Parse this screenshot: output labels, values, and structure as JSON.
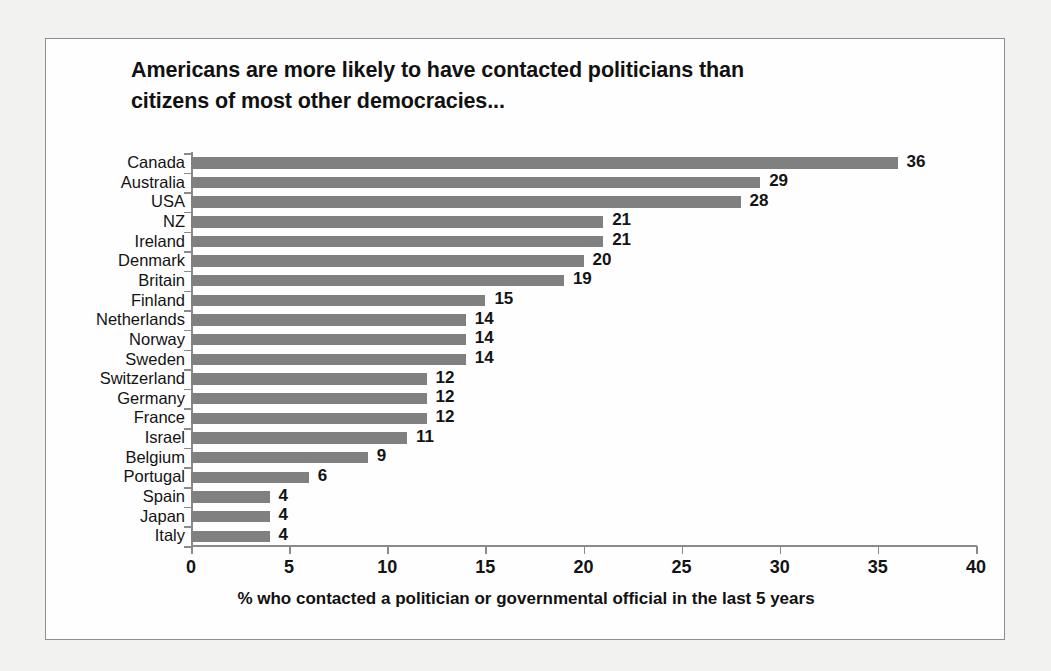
{
  "figure": {
    "background_color": "#f2f2f0",
    "panel_color": "#fefefe",
    "border_color": "#8d8d8d"
  },
  "title": {
    "line1": "Americans are more likely to have contacted politicians than",
    "line2": "citizens of most other democracies..."
  },
  "chart_data": {
    "type": "bar",
    "orientation": "horizontal",
    "title": "Americans are more likely to have contacted politicians than citizens of most other democracies...",
    "xlabel": "% who contacted a politician or governmental official in the last 5 years",
    "ylabel": "",
    "xlim": [
      0,
      40
    ],
    "xticks": [
      0,
      5,
      10,
      15,
      20,
      25,
      30,
      35,
      40
    ],
    "xtick_labels": [
      "0",
      "5",
      "10",
      "15",
      "20",
      "25",
      "30",
      "35",
      "40"
    ],
    "grid": false,
    "legend": false,
    "bar_color": "#808080",
    "data_labels": true,
    "categories": [
      "Canada",
      "Australia",
      "USA",
      "NZ",
      "Ireland",
      "Denmark",
      "Britain",
      "Finland",
      "Netherlands",
      "Norway",
      "Sweden",
      "Switzerland",
      "Germany",
      "France",
      "Israel",
      "Belgium",
      "Portugal",
      "Spain",
      "Japan",
      "Italy"
    ],
    "values": [
      36,
      29,
      28,
      21,
      21,
      20,
      19,
      15,
      14,
      14,
      14,
      12,
      12,
      12,
      11,
      9,
      6,
      4,
      4,
      4
    ],
    "value_labels": [
      "36",
      "29",
      "28",
      "21",
      "21",
      "20",
      "19",
      "15",
      "14",
      "14",
      "14",
      "12",
      "12",
      "12",
      "11",
      "9",
      "6",
      "4",
      "4",
      "4"
    ]
  }
}
